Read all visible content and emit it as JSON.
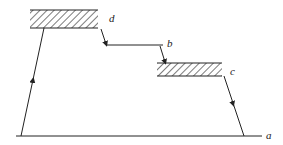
{
  "diagram": {
    "labels": {
      "a": "a",
      "b": "b",
      "c": "c",
      "d": "d"
    },
    "nodes": [
      {
        "id": "d",
        "type": "hatched-level",
        "x": 30,
        "y": 10,
        "width": 68,
        "height": 18
      },
      {
        "id": "b",
        "type": "plain-level",
        "x1": 106,
        "x2": 163,
        "y": 45
      },
      {
        "id": "c",
        "type": "hatched-level",
        "x": 157,
        "y": 63,
        "width": 65,
        "height": 13
      },
      {
        "id": "a",
        "type": "baseline",
        "x1": 16,
        "x2": 262,
        "y": 136
      }
    ],
    "transitions": [
      {
        "from": "a",
        "to": "d",
        "direction": "up"
      },
      {
        "from": "d",
        "to": "b",
        "direction": "down"
      },
      {
        "from": "b",
        "to": "c",
        "direction": "down"
      },
      {
        "from": "c",
        "to": "a",
        "direction": "down"
      }
    ],
    "colors": {
      "line": "#222222",
      "background": "#ffffff"
    }
  }
}
